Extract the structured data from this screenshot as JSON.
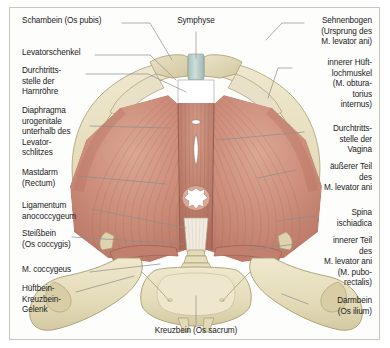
{
  "figure": {
    "title_language": "de",
    "view": "Ansicht von oben",
    "frame_color": "#c9c6bd",
    "background_color": "#fdfdfc"
  },
  "palette": {
    "muscle": "#c98a78",
    "muscle_dark": "#b4715f",
    "muscle_light": "#ddaa98",
    "bone": "#e3dbb8",
    "bone_shadow": "#cfc49b",
    "bone_light": "#efe9cf",
    "symphysis": "#b9ccc6",
    "foramen": "#ffffff",
    "leader_line": "#8d8d8d",
    "text": "#1b1b1b"
  },
  "labels": {
    "left": [
      {
        "id": "schambein",
        "text": "Schambein (Os pubis)",
        "x": 22,
        "y": 20,
        "target_x": 163,
        "target_y": 62
      },
      {
        "id": "levatorschenkel",
        "text": "Levatorschenkel",
        "x": 22,
        "y": 52,
        "target_x": 168,
        "target_y": 83
      },
      {
        "id": "harnroehre",
        "text": "Durchtritts-\nstelle der\nHarnröhre",
        "x": 22,
        "y": 70,
        "target_x": 186,
        "target_y": 92
      },
      {
        "id": "diaphragma",
        "text": "Diaphragma\nurogenitale\nunterhalb des\nLevator-\nschlitzes",
        "x": 22,
        "y": 110,
        "target_x": 178,
        "target_y": 126
      },
      {
        "id": "mastdarm",
        "text": "Mastdarm\n(Rectum)",
        "x": 22,
        "y": 172,
        "target_x": 183,
        "target_y": 200
      },
      {
        "id": "ligamentum",
        "text": "Ligamentum\nanococcygeum",
        "x": 22,
        "y": 205,
        "target_x": 192,
        "target_y": 232
      },
      {
        "id": "steissbein",
        "text": "Steißbein\n(Os coccygis)",
        "x": 22,
        "y": 233,
        "target_x": 190,
        "target_y": 247
      },
      {
        "id": "coccygeus",
        "text": "M. coccygeus",
        "x": 22,
        "y": 268,
        "target_x": 160,
        "target_y": 262
      },
      {
        "id": "huftbein",
        "text": "Hüftbein-\nKreuzbein-\nGelenk",
        "x": 22,
        "y": 288,
        "target_x": 128,
        "target_y": 272
      }
    ],
    "right": [
      {
        "id": "sehnenbogen",
        "text": "Sehnenbogen\n(Ursprung des\nM. levator ani)",
        "x": 308,
        "y": 20,
        "target_x": 268,
        "target_y": 85
      },
      {
        "id": "obturatorius",
        "text": "innerer Hüft-\nlochmuskel\n(M. obtura-\ntorius\ninternus)",
        "x": 296,
        "y": 62,
        "target_x": 280,
        "target_y": 104
      },
      {
        "id": "vagina",
        "text": "Durchtritts-\nstelle der\nVagina",
        "x": 308,
        "y": 128,
        "target_x": 205,
        "target_y": 137
      },
      {
        "id": "levator_aussen",
        "text": "äußerer Teil\ndes\nM. levator ani",
        "x": 300,
        "y": 166,
        "target_x": 258,
        "target_y": 178
      },
      {
        "id": "spina",
        "text": "Spina\nischiadica",
        "x": 318,
        "y": 212,
        "target_x": 275,
        "target_y": 219
      },
      {
        "id": "levator_innen",
        "text": "innerer Teil\ndes\nM. levator ani\n(M. pubo-\nrectalis)",
        "x": 300,
        "y": 240,
        "target_x": 252,
        "target_y": 247
      },
      {
        "id": "darmbein",
        "text": "Darmbein\n(Os ilium)",
        "x": 312,
        "y": 300,
        "target_x": 282,
        "target_y": 292
      }
    ],
    "top": [
      {
        "id": "symphyse",
        "text": "Symphyse",
        "x": 185,
        "y": 20,
        "target_x": 195,
        "target_y": 62
      }
    ],
    "bottom": [
      {
        "id": "kreuzbein",
        "text": "Kreuzbein (Os sacrum)",
        "x": 195,
        "y": 330,
        "target_x": 196,
        "target_y": 300
      }
    ]
  },
  "anatomy": {
    "structures": [
      {
        "name": "Os pubis",
        "type": "bone"
      },
      {
        "name": "Symphysis pubica",
        "type": "cartilage"
      },
      {
        "name": "Os ilium",
        "type": "bone"
      },
      {
        "name": "Os sacrum",
        "type": "bone"
      },
      {
        "name": "Os coccygis",
        "type": "bone"
      },
      {
        "name": "Spina ischiadica",
        "type": "bone"
      },
      {
        "name": "Foramen obturatum",
        "type": "opening"
      },
      {
        "name": "M. levator ani",
        "type": "muscle"
      },
      {
        "name": "M. puborectalis",
        "type": "muscle"
      },
      {
        "name": "M. obturatorius internus",
        "type": "muscle"
      },
      {
        "name": "M. coccygeus",
        "type": "muscle"
      },
      {
        "name": "Lig. anococcygeum",
        "type": "ligament"
      },
      {
        "name": "Hiatus urethrae",
        "type": "opening"
      },
      {
        "name": "Hiatus vaginae",
        "type": "opening"
      },
      {
        "name": "Rectum",
        "type": "opening"
      },
      {
        "name": "Diaphragma urogenitale",
        "type": "membrane"
      },
      {
        "name": "Articulatio sacroiliaca",
        "type": "joint"
      }
    ]
  }
}
